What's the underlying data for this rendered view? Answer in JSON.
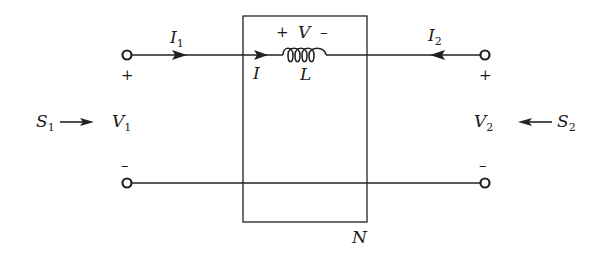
{
  "diagram": {
    "network_label": "N",
    "port1": {
      "current_label": "I",
      "current_sub": "1",
      "voltage_label": "V",
      "voltage_sub": "1",
      "plus": "+",
      "minus": "–",
      "source_label": "S",
      "source_sub": "1"
    },
    "port2": {
      "current_label": "I",
      "current_sub": "2",
      "voltage_label": "V",
      "voltage_sub": "2",
      "plus": "+",
      "minus": "–",
      "source_label": "S",
      "source_sub": "2"
    },
    "inductor": {
      "label": "L",
      "voltage_label": "V",
      "plus": "+",
      "minus": "–",
      "current_label": "I"
    }
  }
}
